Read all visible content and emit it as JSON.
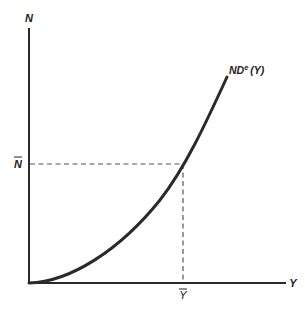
{
  "diagram": {
    "type": "economic-graph",
    "y_axis": {
      "label": "N"
    },
    "x_axis": {
      "label": "Y"
    },
    "curve": {
      "label_main": "ND",
      "label_sup": "e",
      "label_arg": "(Y)",
      "description": "upward-sloping convex curve starting at origin"
    },
    "markers": {
      "n_bar": {
        "label": "N",
        "accent": "bar",
        "description": "horizontal dashed reference line"
      },
      "y_bar": {
        "label": "Y",
        "accent": "bar",
        "description": "vertical dashed reference line"
      }
    },
    "colors": {
      "line": "#2a2a2a",
      "dashed": "#555555",
      "text": "#222222",
      "background": "#ffffff"
    }
  }
}
